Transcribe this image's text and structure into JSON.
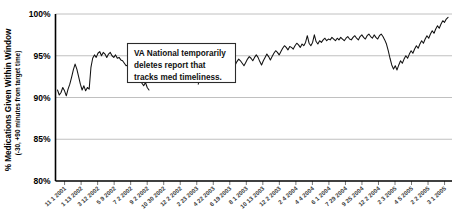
{
  "chart_data": {
    "type": "line",
    "title": "",
    "xlabel": "",
    "ylabel": "% Medications Given Within Window",
    "ylabel_sub": "(-30, +90 minutes from target time)",
    "ylim": [
      80,
      100
    ],
    "ytick_labels": [
      "80%",
      "85%",
      "90%",
      "95%",
      "100%"
    ],
    "ytick_values": [
      80,
      85,
      90,
      95,
      100
    ],
    "grid": true,
    "legend": "none",
    "xtick_labels": [
      "11 1 2001",
      "1 13 2002",
      "3 12 2002",
      "5 9 2002",
      "7 2 2002",
      "9 2 2002",
      "10 30 2002",
      "12 2 2002",
      "2 23 2003",
      "4 22 2003",
      "6 19 2003",
      "8 1 2003",
      "10 13 2003",
      "12 2 2003",
      "2 4 2004",
      "4 4 2004",
      "6 1 2004",
      "7 29 2004",
      "9 25 2004",
      "12 2 2004",
      "2 3 2005",
      "4 5 2005",
      "2 2 2005",
      "3 1 2005"
    ],
    "annotations": [
      {
        "id": "va-national-note",
        "lines": [
          "VA National temporarily",
          "deletes report that",
          "tracks med timeliness."
        ]
      }
    ],
    "series": [
      {
        "name": "% Medications Given Within Window",
        "values": [
          90.9,
          90.3,
          90.6,
          91.2,
          90.8,
          90.2,
          91.0,
          91.6,
          92.4,
          93.3,
          94.0,
          93.4,
          92.5,
          91.6,
          90.9,
          91.4,
          90.8,
          91.2,
          91.0,
          93.6,
          94.7,
          95.1,
          94.8,
          95.3,
          95.5,
          95.0,
          95.4,
          95.2,
          94.8,
          95.2,
          95.4,
          95.0,
          94.8,
          95.1,
          94.7,
          94.8,
          94.5,
          94.4,
          94.1,
          93.8,
          93.9,
          93.5,
          93.2,
          93.3,
          92.9,
          92.6,
          92.3,
          92.0,
          91.7,
          91.4,
          91.8,
          91.2,
          90.9,
          null,
          null,
          null,
          null,
          null,
          null,
          null,
          null,
          null,
          null,
          null,
          null,
          null,
          null,
          null,
          null,
          null,
          null,
          null,
          null,
          null,
          null,
          null,
          null,
          null,
          null,
          null,
          91.6,
          92.3,
          92.1,
          92.8,
          93.2,
          92.9,
          92.6,
          92.3,
          92.7,
          93.1,
          93.4,
          93.6,
          93.3,
          93.7,
          94.0,
          93.8,
          93.5,
          93.9,
          94.2,
          94.0,
          93.6,
          93.9,
          94.3,
          94.6,
          94.4,
          94.1,
          93.8,
          94.2,
          94.6,
          94.9,
          94.7,
          94.4,
          94.8,
          95.1,
          94.8,
          94.3,
          93.9,
          94.4,
          94.8,
          95.2,
          94.9,
          94.5,
          94.9,
          95.3,
          95.6,
          95.4,
          95.1,
          95.5,
          95.9,
          96.2,
          96.0,
          95.7,
          96.1,
          96.0,
          95.8,
          96.2,
          96.5,
          96.3,
          96.0,
          96.4,
          96.2,
          96.6,
          97.4,
          96.5,
          96.2,
          96.6,
          97.5,
          96.7,
          96.4,
          96.8,
          96.6,
          96.9,
          97.1,
          96.8,
          97.0,
          96.9,
          97.2,
          97.0,
          96.8,
          97.1,
          96.9,
          97.2,
          97.0,
          96.8,
          97.1,
          97.3,
          97.0,
          96.9,
          97.2,
          97.4,
          97.1,
          96.9,
          97.3,
          97.5,
          97.2,
          97.0,
          97.4,
          97.6,
          97.3,
          97.1,
          97.5,
          97.2,
          97.0,
          97.4,
          97.6,
          97.3,
          96.9,
          96.4,
          95.6,
          94.7,
          93.9,
          93.4,
          93.8,
          93.3,
          93.9,
          94.4,
          94.1,
          94.6,
          95.0,
          94.7,
          95.2,
          95.6,
          95.3,
          95.8,
          96.2,
          95.9,
          96.4,
          96.8,
          96.5,
          97.0,
          97.4,
          97.1,
          97.6,
          98.0,
          97.7,
          98.2,
          98.6,
          98.3,
          98.8,
          99.2,
          99.0,
          99.4,
          99.6
        ]
      }
    ]
  }
}
